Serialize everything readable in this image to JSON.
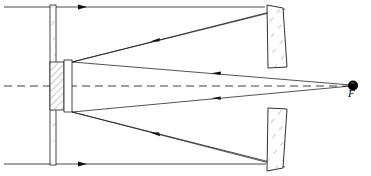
{
  "figure": {
    "kind": "optical-ray-diagram",
    "width": 371,
    "height": 176,
    "background_color": "#ffffff",
    "line_color": "#1a1a1a",
    "hatch_color": "#555555",
    "dash_color": "#333333"
  },
  "labels": {
    "focus": "F"
  },
  "elements": {
    "corrector_plate": {
      "name": "corrector-plate",
      "x": 50.0,
      "y": 5.0,
      "width": 6.0,
      "height": 160.0,
      "fill": "#ffffff",
      "hatched": true
    },
    "secondary_block_hatched": {
      "name": "secondary-hatched-block",
      "x": 50.0,
      "y": 62.0,
      "width": 14.0,
      "height": 48.0,
      "fill": "#ffffff",
      "hatched": true
    },
    "secondary_block_plain": {
      "name": "secondary-plain-block",
      "x": 64.0,
      "y": 60.0,
      "width": 8.0,
      "height": 52.0,
      "fill": "#ffffff",
      "hatched": false
    },
    "mirror_upper": {
      "name": "primary-mirror-upper-segment",
      "points": "267,5 283,8 287,67 268,68",
      "fill": "#ffffff",
      "hatched": true
    },
    "mirror_lower": {
      "name": "primary-mirror-lower-segment",
      "points": "268,108 287,109 283,168 267,171",
      "fill": "#ffffff",
      "hatched": true
    },
    "focal_point": {
      "name": "focal-point",
      "cx": 353.0,
      "cy": 85.5,
      "r": 5.0,
      "fill": "#000000"
    }
  },
  "optical_axis": {
    "name": "optical-axis",
    "x1": 4.0,
    "y1": 86.0,
    "x2": 350.0,
    "y2": 86.0,
    "style": "dashed"
  },
  "rays": [
    {
      "name": "incoming-ray-top",
      "points": "4,7 265,7",
      "arrows": [
        {
          "x": 83,
          "y": 7,
          "dir": "right"
        }
      ]
    },
    {
      "name": "incoming-ray-bottom",
      "points": "4,164 266,164",
      "arrows": [
        {
          "x": 83,
          "y": 164,
          "dir": "right"
        }
      ]
    },
    {
      "name": "reflected-ray-upper-to-secondary",
      "points": "270,12 72,62",
      "arrows": [
        {
          "x": 155,
          "y": 41,
          "dir": "left-down"
        }
      ]
    },
    {
      "name": "reflected-ray-lower-to-secondary",
      "points": "270,162 72,112",
      "arrows": [
        {
          "x": 155,
          "y": 133,
          "dir": "left-up"
        }
      ]
    },
    {
      "name": "converging-ray-upper-to-focus",
      "points": "350,85 72,62",
      "arrows": [
        {
          "x": 215,
          "y": 73,
          "dir": "left"
        }
      ]
    },
    {
      "name": "converging-ray-lower-to-focus",
      "points": "350,86 72,112",
      "arrows": [
        {
          "x": 215,
          "y": 98,
          "dir": "left"
        }
      ]
    },
    {
      "name": "edge-ray-upper-outer",
      "points": "72,62 285,9"
    },
    {
      "name": "edge-ray-lower-outer",
      "points": "72,112 285,167"
    }
  ],
  "annotations": [
    {
      "name": "focus-label",
      "text": "F",
      "x": 348,
      "y": 93
    }
  ]
}
